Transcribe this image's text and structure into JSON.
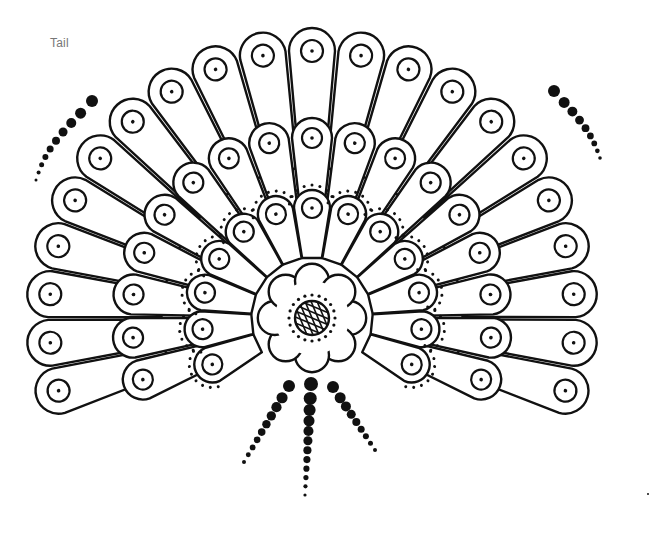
{
  "title": "Tail",
  "colors": {
    "ink": "#111111",
    "paper": "#ffffff",
    "label": "#777777"
  },
  "rings": [
    {
      "name": "outer-ring",
      "feather_count": 21,
      "start_deg": 196,
      "end_deg": -16
    },
    {
      "name": "middle-ring",
      "feather_count": 17,
      "start_deg": 200,
      "end_deg": -20
    },
    {
      "name": "inner-ring",
      "feather_count": 13,
      "start_deg": 205,
      "end_deg": -25,
      "dotted_border": true
    }
  ],
  "center_flower": {
    "petal_count": 8,
    "crosshatched_center": true
  },
  "dot_trails": [
    {
      "name": "left-top-trail",
      "dot_count": 10
    },
    {
      "name": "right-top-trail",
      "dot_count": 9
    },
    {
      "name": "bottom-left-trail",
      "dot_count": 10
    },
    {
      "name": "bottom-center-trail",
      "dot_count": 12
    },
    {
      "name": "bottom-right-trail",
      "dot_count": 9
    }
  ]
}
